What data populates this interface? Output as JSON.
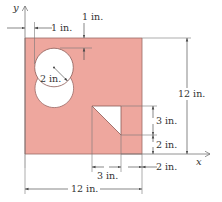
{
  "figure": {
    "type": "plate with circular and triangular cutouts",
    "colors": {
      "plate_fill": "#EEA79E",
      "plate_edge": "#9a6a66",
      "hole_fill": "#ffffff",
      "dimension_lines": "#555555"
    },
    "axes": {
      "x_label": "x",
      "y_label": "y"
    },
    "dimensions": {
      "top_offset": "1 in.",
      "left_offset": "1 in.",
      "circle_radius": "2 in.",
      "plate_height": "12 in.",
      "triangle_height": "3 in.",
      "triangle_bottom_offset": "2 in.",
      "triangle_width": "3 in.",
      "triangle_right_offset": "2 in.",
      "plate_width": "12 in."
    }
  }
}
